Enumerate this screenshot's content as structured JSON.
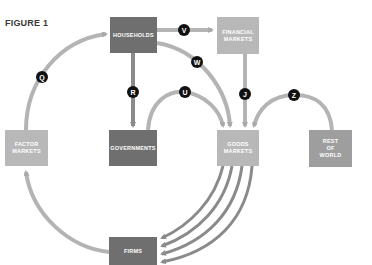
{
  "figure": {
    "title": "FIGURE 1"
  },
  "nodes": {
    "households": {
      "label": "HOUSEHOLDS"
    },
    "financial_markets": {
      "line1": "FINANCIAL",
      "line2": "MARKETS"
    },
    "factor_markets": {
      "line1": "FACTOR",
      "line2": "MARKETS"
    },
    "governments": {
      "label": "GOVERNMENTS"
    },
    "goods_markets": {
      "line1": "GOODS",
      "line2": "MARKETS"
    },
    "rest_of_world": {
      "line1": "REST",
      "line2": "OF",
      "line3": "WORLD"
    },
    "firms": {
      "label": "FIRMS"
    }
  },
  "flows": [
    {
      "label": "Q",
      "from": "factor_markets",
      "to": "households"
    },
    {
      "label": "V",
      "from": "households",
      "to": "financial_markets"
    },
    {
      "label": "W",
      "from": "households",
      "to": "goods_markets"
    },
    {
      "label": "R",
      "from": "households",
      "to": "governments"
    },
    {
      "label": "U",
      "from": "governments",
      "to": "goods_markets"
    },
    {
      "label": "J",
      "from": "financial_markets",
      "to": "goods_markets"
    },
    {
      "label": "Z",
      "from": "rest_of_world",
      "to": "goods_markets"
    },
    {
      "label": "",
      "from": "goods_markets",
      "to": "firms",
      "count": 4
    },
    {
      "label": "",
      "from": "firms",
      "to": "factor_markets"
    }
  ],
  "colors": {
    "dark_box": "#6f6f6f",
    "light_box": "#b8b8b8",
    "mid_box": "#9e9e9e",
    "arrow": "#b4b4b4",
    "arrow_dark": "#8a8a8a",
    "badge": "#111111"
  }
}
